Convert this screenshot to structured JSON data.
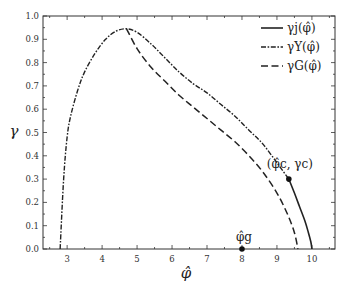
{
  "chart_data": {
    "type": "line",
    "title": "",
    "xlabel": "φ̂",
    "ylabel": "γ",
    "xlim": [
      2.31,
      10.66
    ],
    "ylim": [
      0.0,
      1.0
    ],
    "grid": false,
    "legend_position": "upper right",
    "x_ticks": [
      3,
      4,
      5,
      6,
      7,
      8,
      9,
      10
    ],
    "y_ticks": [
      0.0,
      0.1,
      0.2,
      0.3,
      0.4,
      0.5,
      0.6,
      0.7,
      0.8,
      0.9,
      1.0
    ],
    "x_tick_labels": [
      "3",
      "4",
      "5",
      "6",
      "7",
      "8",
      "9",
      "10"
    ],
    "y_tick_labels": [
      "0.0",
      "0.1",
      "0.2",
      "0.3",
      "0.4",
      "0.5",
      "0.6",
      "0.7",
      "0.8",
      "0.9",
      "1.0"
    ],
    "series": [
      {
        "name": "γj(φ̂)",
        "style": "solid",
        "x": [
          9.34,
          9.5,
          9.65,
          9.8,
          9.9,
          9.97,
          10.0
        ],
        "y": [
          0.3,
          0.24,
          0.18,
          0.12,
          0.07,
          0.03,
          0.0
        ]
      },
      {
        "name": "γY(φ̂)",
        "style": "dashdot",
        "x": [
          2.8,
          2.9,
          3.0,
          3.1,
          3.3,
          3.5,
          3.8,
          4.1,
          4.4,
          4.7,
          5.0,
          5.4,
          5.8,
          6.2,
          6.6,
          7.0,
          7.4,
          7.8,
          8.2,
          8.6,
          9.0,
          9.34
        ],
        "y": [
          0.0,
          0.3,
          0.48,
          0.57,
          0.68,
          0.76,
          0.84,
          0.9,
          0.935,
          0.945,
          0.93,
          0.88,
          0.82,
          0.76,
          0.71,
          0.67,
          0.62,
          0.57,
          0.51,
          0.45,
          0.37,
          0.3
        ]
      },
      {
        "name": "γG(φ̂)",
        "style": "dashed",
        "x": [
          4.7,
          5.0,
          5.4,
          5.8,
          6.2,
          6.6,
          7.0,
          7.4,
          7.8,
          8.2,
          8.6,
          9.0,
          9.3,
          9.5,
          9.6
        ],
        "y": [
          0.945,
          0.86,
          0.78,
          0.72,
          0.66,
          0.61,
          0.56,
          0.51,
          0.46,
          0.4,
          0.33,
          0.24,
          0.15,
          0.07,
          0.0
        ]
      }
    ],
    "annotations": [
      {
        "label": "(φ̂c, γc)",
        "x": 9.34,
        "y": 0.3,
        "marker": "dot"
      },
      {
        "label": "φ̂g",
        "x": 8.0,
        "y": 0.0,
        "marker": "dot"
      }
    ]
  },
  "legend": {
    "items": [
      {
        "label": "γj(φ̂)"
      },
      {
        "label": "γY(φ̂)"
      },
      {
        "label": "γG(φ̂)"
      }
    ]
  },
  "labels": {
    "xlabel": "φ̂",
    "ylabel": "γ",
    "critical_point": "(φ̂c, γc)",
    "glass_point": "φ̂g"
  }
}
